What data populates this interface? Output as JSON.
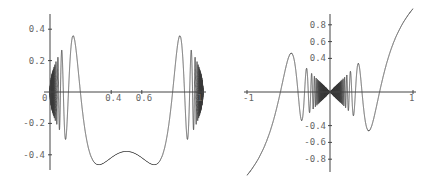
{
  "chart_data": [
    {
      "type": "line",
      "title": "",
      "xlabel": "",
      "ylabel": "",
      "xlim": [
        0,
        1
      ],
      "ylim": [
        -0.5,
        0.5
      ],
      "grid": false,
      "legend": null,
      "x_ticks": [
        "0",
        "0.4",
        "0.6",
        "1"
      ],
      "x_tick_values": [
        0,
        0.4,
        0.6,
        1
      ],
      "y_ticks": [
        "0.4",
        "0.2",
        "-0.2",
        "-0.4"
      ],
      "y_tick_values": [
        0.4,
        0.2,
        -0.2,
        -0.4
      ],
      "description": "Rapidly oscillating curve bounded by semicircular envelope sqrt(x(1-x)); oscillations accumulate densely near x=0 and x=1, slow near x=0.5 (local max ~-0.15 at x=0.5, minima ~-0.48 at x~0.43 and x~0.57, maxima ~0.48 at x~0.34 and x~0.66)",
      "function": "sqrt(x(1-x)) * sin(1/(x(1-x)))",
      "series": [
        {
          "name": "f",
          "x": [
            0.34,
            0.43,
            0.5,
            0.57,
            0.66
          ],
          "y": [
            0.47,
            -0.49,
            -0.15,
            -0.49,
            0.47
          ]
        }
      ]
    },
    {
      "type": "line",
      "title": "",
      "xlabel": "",
      "ylabel": "",
      "xlim": [
        -1,
        1
      ],
      "ylim": [
        -0.95,
        0.95
      ],
      "grid": false,
      "legend": null,
      "x_ticks": [
        "-1",
        "1"
      ],
      "x_tick_values": [
        -1,
        1
      ],
      "y_ticks": [
        "0.8",
        "0.6",
        "0.4",
        "-0.4",
        "-0.6",
        "-0.8"
      ],
      "y_tick_values": [
        0.8,
        0.6,
        0.4,
        -0.4,
        -0.6,
        -0.8
      ],
      "description": "Odd oscillating curve bounded by envelope |x|, oscillations accumulate densely near x=0 (bow-tie shape); peak ~0.9 near x=0.93, trough ~-0.9 near x=-0.93",
      "function": "x * sin(1/x^2)",
      "series": [
        {
          "name": "g",
          "x": [
            -0.93,
            -0.71,
            0.71,
            0.93
          ],
          "y": [
            -0.9,
            0.68,
            -0.68,
            0.9
          ]
        }
      ]
    }
  ],
  "plots": [
    {
      "px": {
        "x0": 50,
        "x1": 203,
        "y0": 92,
        "yscale": 157
      },
      "x_ticks": [
        {
          "v": 0,
          "label": "0"
        },
        {
          "v": 0.4,
          "label": "0.4"
        },
        {
          "v": 0.6,
          "label": "0.6"
        },
        {
          "v": 1,
          "label": "1"
        }
      ],
      "y_ticks": [
        {
          "v": 0.4,
          "label": "0.4"
        },
        {
          "v": 0.2,
          "label": "0.2"
        },
        {
          "v": -0.2,
          "label": "-0.2"
        },
        {
          "v": -0.4,
          "label": "-0.4"
        }
      ]
    },
    {
      "px": {
        "x0": 247,
        "x1": 413,
        "y0": 92,
        "yscale": 84
      },
      "x_ticks": [
        {
          "v": -1,
          "label": "-1"
        },
        {
          "v": 1,
          "label": "1"
        }
      ],
      "y_ticks": [
        {
          "v": 0.8,
          "label": "0.8"
        },
        {
          "v": 0.6,
          "label": "0.6"
        },
        {
          "v": 0.4,
          "label": "0.4"
        },
        {
          "v": -0.4,
          "label": "-0.4"
        },
        {
          "v": -0.6,
          "label": "-0.6"
        },
        {
          "v": -0.8,
          "label": "-0.8"
        }
      ]
    }
  ]
}
